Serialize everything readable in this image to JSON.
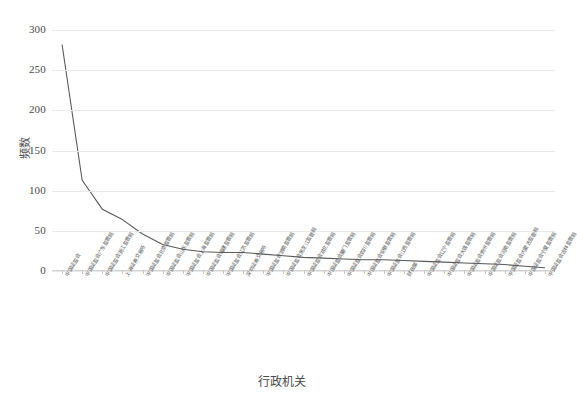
{
  "chart_data": {
    "type": "line",
    "title": "",
    "xlabel": "行政机关",
    "ylabel": "频数",
    "ylim": [
      0,
      300
    ],
    "yticks": [
      0,
      50,
      100,
      150,
      200,
      250,
      300
    ],
    "grid": true,
    "legend": "none",
    "line_color": "#595959",
    "categories": [
      "中国证监会",
      "中国证监会广东监管局",
      "中国证监会浙江监管局",
      "上海证券交易所",
      "中国证监会北京监管局",
      "中国证监会山东监管局",
      "中国证监会上海监管局",
      "中国证监会福建监管局",
      "中国证监会江苏监管局",
      "深圳证券交易所",
      "中国证监会湖南监管局",
      "中国证监会黑龙江监管局",
      "中国证监会湖北监管局",
      "中国证监会厦门监管局",
      "中国证监会四川监管局",
      "中国证监会安徽监管局",
      "中国证监会江西监管局",
      "财政部",
      "中国证监会辽宁监管局",
      "中国证监会大连监管局",
      "中国证监会贵州监管局",
      "中国证监会河南监管局",
      "中国证监会内蒙古监管局",
      "中国证监会宁夏监管局",
      "中国证监会吉林监管局"
    ],
    "values": [
      282,
      113,
      77,
      64,
      46,
      33,
      27,
      24,
      23,
      23,
      21,
      19,
      17,
      16,
      15,
      14,
      14,
      13,
      12,
      11,
      10,
      9,
      8,
      6,
      4
    ],
    "series": [
      {
        "name": "频数",
        "values": [
          282,
          113,
          77,
          64,
          46,
          33,
          27,
          24,
          23,
          23,
          21,
          19,
          17,
          16,
          15,
          14,
          14,
          13,
          12,
          11,
          10,
          9,
          8,
          6,
          4
        ]
      }
    ]
  }
}
